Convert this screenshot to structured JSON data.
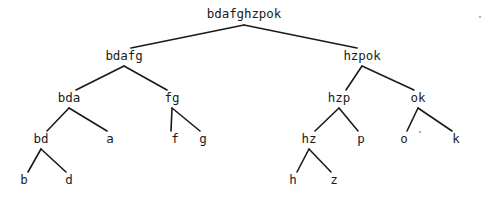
{
  "figure": {
    "kind": "binary-merge-tree-diagram",
    "background_color": "#ffffff",
    "ink_color": "#1a1a1a",
    "width": 486,
    "height": 199
  },
  "tree": {
    "nodes": [
      {
        "id": "n0",
        "label": "bdafghzpok",
        "x": 244,
        "y": 14,
        "level": 0
      },
      {
        "id": "n1",
        "label": "bdafg",
        "x": 124,
        "y": 56,
        "level": 1
      },
      {
        "id": "n2",
        "label": "hzpok",
        "x": 362,
        "y": 56,
        "level": 1
      },
      {
        "id": "n3",
        "label": "bda",
        "x": 69,
        "y": 98,
        "level": 2
      },
      {
        "id": "n4",
        "label": "fg",
        "x": 172,
        "y": 98,
        "level": 2
      },
      {
        "id": "n5",
        "label": "hzp",
        "x": 339,
        "y": 98,
        "level": 2
      },
      {
        "id": "n6",
        "label": "ok",
        "x": 418,
        "y": 98,
        "level": 2
      },
      {
        "id": "n7",
        "label": "bd",
        "x": 41,
        "y": 139,
        "level": 3
      },
      {
        "id": "n8",
        "label": "a",
        "x": 110,
        "y": 139,
        "level": 3
      },
      {
        "id": "n9",
        "label": "f",
        "x": 175,
        "y": 139,
        "level": 3
      },
      {
        "id": "n10",
        "label": "g",
        "x": 203,
        "y": 139,
        "level": 3
      },
      {
        "id": "n11",
        "label": "hz",
        "x": 309,
        "y": 139,
        "level": 3
      },
      {
        "id": "n12",
        "label": "p",
        "x": 361,
        "y": 139,
        "level": 3
      },
      {
        "id": "n13",
        "label": "o",
        "x": 404,
        "y": 139,
        "level": 3
      },
      {
        "id": "n14",
        "label": "k",
        "x": 456,
        "y": 139,
        "level": 3
      },
      {
        "id": "n15",
        "label": "b",
        "x": 24,
        "y": 180,
        "level": 4
      },
      {
        "id": "n16",
        "label": "d",
        "x": 69,
        "y": 180,
        "level": 4
      },
      {
        "id": "n17",
        "label": "h",
        "x": 293,
        "y": 180,
        "level": 4
      },
      {
        "id": "n18",
        "label": "z",
        "x": 334,
        "y": 180,
        "level": 4
      }
    ],
    "edges": [
      {
        "from": "n0",
        "to": "n1",
        "x1": 244,
        "y1": 25,
        "x2": 131,
        "y2": 48
      },
      {
        "from": "n0",
        "to": "n2",
        "x1": 244,
        "y1": 25,
        "x2": 357,
        "y2": 48
      },
      {
        "from": "n1",
        "to": "n3",
        "x1": 124,
        "y1": 66,
        "x2": 76,
        "y2": 90
      },
      {
        "from": "n1",
        "to": "n4",
        "x1": 124,
        "y1": 66,
        "x2": 167,
        "y2": 90
      },
      {
        "from": "n2",
        "to": "n5",
        "x1": 362,
        "y1": 66,
        "x2": 346,
        "y2": 90
      },
      {
        "from": "n2",
        "to": "n6",
        "x1": 362,
        "y1": 66,
        "x2": 414,
        "y2": 90
      },
      {
        "from": "n3",
        "to": "n7",
        "x1": 69,
        "y1": 108,
        "x2": 47,
        "y2": 131
      },
      {
        "from": "n3",
        "to": "n8",
        "x1": 69,
        "y1": 108,
        "x2": 107,
        "y2": 131
      },
      {
        "from": "n4",
        "to": "n9",
        "x1": 172,
        "y1": 108,
        "x2": 171,
        "y2": 131
      },
      {
        "from": "n4",
        "to": "n10",
        "x1": 172,
        "y1": 108,
        "x2": 200,
        "y2": 131
      },
      {
        "from": "n5",
        "to": "n11",
        "x1": 339,
        "y1": 108,
        "x2": 315,
        "y2": 131
      },
      {
        "from": "n5",
        "to": "n12",
        "x1": 339,
        "y1": 108,
        "x2": 358,
        "y2": 131
      },
      {
        "from": "n6",
        "to": "n13",
        "x1": 418,
        "y1": 108,
        "x2": 407,
        "y2": 131
      },
      {
        "from": "n6",
        "to": "n14",
        "x1": 418,
        "y1": 108,
        "x2": 452,
        "y2": 131
      },
      {
        "from": "n7",
        "to": "n15",
        "x1": 41,
        "y1": 149,
        "x2": 28,
        "y2": 172
      },
      {
        "from": "n7",
        "to": "n16",
        "x1": 41,
        "y1": 149,
        "x2": 66,
        "y2": 172
      },
      {
        "from": "n11",
        "to": "n17",
        "x1": 309,
        "y1": 149,
        "x2": 297,
        "y2": 172
      },
      {
        "from": "n11",
        "to": "n18",
        "x1": 309,
        "y1": 149,
        "x2": 331,
        "y2": 172
      }
    ],
    "specks": [
      {
        "x": 419,
        "y": 131
      },
      {
        "x": 479,
        "y": 16
      }
    ]
  }
}
